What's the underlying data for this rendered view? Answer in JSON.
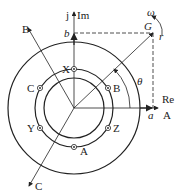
{
  "diagram": {
    "axes": {
      "real_label": "Re",
      "imag_label": "Im",
      "j_label": "j",
      "phase_a_axis": "A",
      "phase_b_axis": "B",
      "phase_c_axis": "C"
    },
    "vector": {
      "label": "G",
      "angle_label": "θ",
      "speed_label": "ω",
      "rotation_label": "r",
      "projection_real": "a",
      "projection_imag": "b"
    },
    "coils": [
      {
        "label": "X"
      },
      {
        "label": "B"
      },
      {
        "label": "C"
      },
      {
        "label": "Z"
      },
      {
        "label": "Y"
      },
      {
        "label": "A"
      }
    ],
    "colors": {
      "stroke": "#222222",
      "background": "#ffffff"
    }
  }
}
